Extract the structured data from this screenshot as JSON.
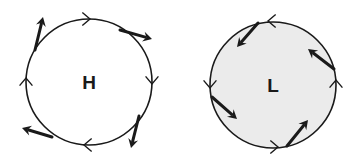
{
  "diagram": {
    "title": "",
    "colors": {
      "stroke": "#1a1a1a",
      "high_fill": "#ffffff",
      "low_fill": "#ebebeb",
      "background": "#ffffff"
    },
    "systems": [
      {
        "id": "high",
        "label": "H",
        "meaning": "high pressure",
        "circulation": "clockwise",
        "flow": "outward"
      },
      {
        "id": "low",
        "label": "L",
        "meaning": "low pressure",
        "circulation": "counterclockwise",
        "flow": "inward"
      }
    ]
  }
}
